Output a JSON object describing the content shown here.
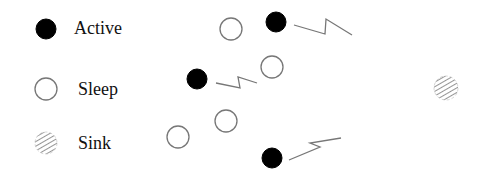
{
  "legend": {
    "items": [
      {
        "label": "Active",
        "type": "active",
        "cx": 46,
        "cy": 29,
        "r": 10,
        "label_x": 74,
        "label_y": 19
      },
      {
        "label": "Sleep",
        "type": "sleep",
        "cx": 46,
        "cy": 89,
        "r": 11,
        "label_x": 78,
        "label_y": 80
      },
      {
        "label": "Sink",
        "type": "sink",
        "cx": 46,
        "cy": 143,
        "r": 11,
        "label_x": 78,
        "label_y": 134
      }
    ]
  },
  "nodes": [
    {
      "type": "sleep",
      "cx": 231,
      "cy": 29,
      "r": 11
    },
    {
      "type": "active",
      "cx": 276,
      "cy": 22,
      "r": 10
    },
    {
      "type": "active",
      "cx": 197,
      "cy": 79,
      "r": 10
    },
    {
      "type": "sleep",
      "cx": 272,
      "cy": 67,
      "r": 11
    },
    {
      "type": "sleep",
      "cx": 226,
      "cy": 121,
      "r": 11
    },
    {
      "type": "sleep",
      "cx": 178,
      "cy": 137,
      "r": 11
    },
    {
      "type": "active",
      "cx": 272,
      "cy": 158,
      "r": 10
    },
    {
      "type": "sink",
      "cx": 446,
      "cy": 88,
      "r": 12
    }
  ],
  "links": [
    {
      "points": "294,25 325,34 326,19 352,35"
    },
    {
      "points": "216,83 240,88 238,77 257,83"
    },
    {
      "points": "289,160 320,147 310,143 341,138"
    }
  ],
  "colors": {
    "active_fill": "#000000",
    "stroke": "#777777",
    "link": "#777777"
  }
}
